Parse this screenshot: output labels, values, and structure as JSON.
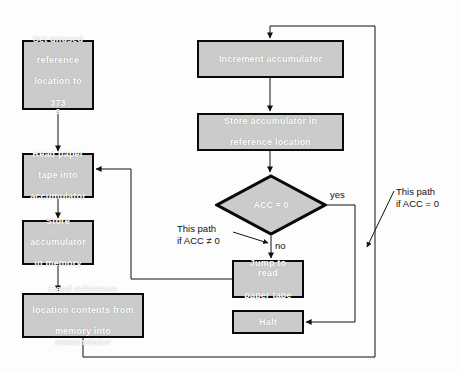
{
  "diagram": {
    "fill_color": "#cbcbcb",
    "border_color": "#0a0a0a",
    "node_text_color": "#ffffff",
    "annotation_text_color": "#111111",
    "background": "#fdfdfd"
  },
  "nodes": {
    "set_reference": {
      "shape": "process",
      "line1": "Set unused",
      "line2": "reference",
      "line3": "location to",
      "value": "373",
      "value_subscript": "8"
    },
    "read_tape": {
      "shape": "process",
      "line1": "Read paper",
      "line2": "tape into",
      "line3": "accumulator"
    },
    "store_memory": {
      "shape": "process",
      "line1": "Store",
      "line2": "accumulator",
      "line3": "in memory"
    },
    "read_reference": {
      "shape": "process",
      "line1": "Read reference",
      "line2": "location contents from",
      "line3": "memory into accumulator"
    },
    "increment": {
      "shape": "process",
      "line1": "Increment accumulator"
    },
    "store_reference": {
      "shape": "process",
      "line1": "Store accumulator in",
      "line2": "reference location"
    },
    "decision": {
      "shape": "decision",
      "label": "ACC = 0"
    },
    "jump": {
      "shape": "process",
      "line1": "Jump to read",
      "line2": "paper tape"
    },
    "halt": {
      "shape": "process",
      "line1": "Halt"
    }
  },
  "edge_labels": {
    "yes": "yes",
    "no": "no"
  },
  "annotations": {
    "not_equal": "This path\nif ACC ≠ 0",
    "equal": "This path\nif ACC = 0"
  }
}
